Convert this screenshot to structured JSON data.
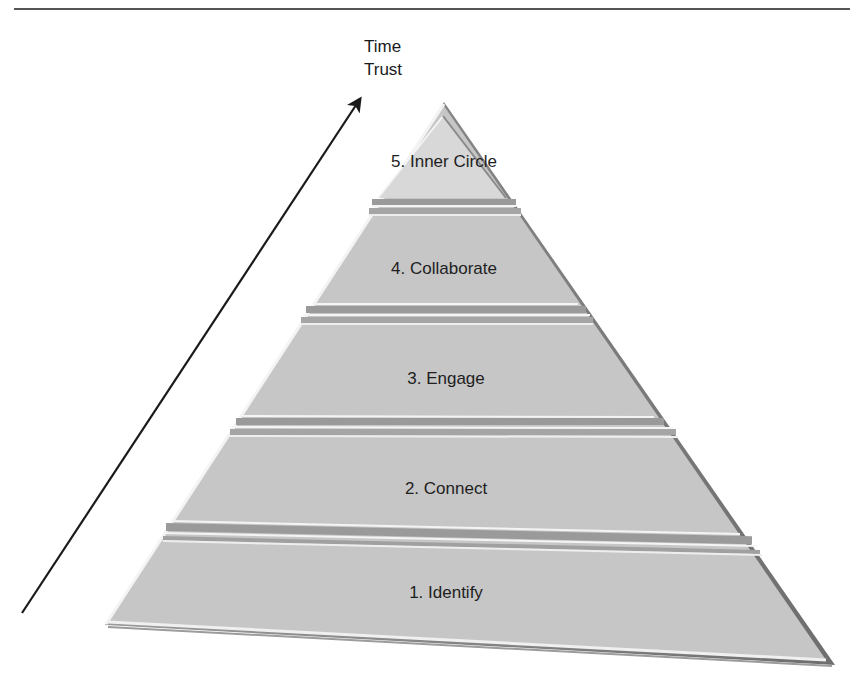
{
  "diagram": {
    "type": "pyramid",
    "axis": {
      "labels": [
        "Time",
        "Trust"
      ],
      "direction": "up"
    },
    "tiers": [
      {
        "level": 5,
        "label": "5. Inner Circle"
      },
      {
        "level": 4,
        "label": "4. Collaborate"
      },
      {
        "level": 3,
        "label": "3. Engage"
      },
      {
        "level": 2,
        "label": "2. Connect"
      },
      {
        "level": 1,
        "label": "1. Identify"
      }
    ],
    "colors": {
      "fill": "#c4c4c4",
      "top_tier_fill": "#d6d6d6",
      "edge_dark": "#7a7a7a",
      "highlight": "#f2f2f2",
      "text": "#1e1e1e"
    }
  }
}
